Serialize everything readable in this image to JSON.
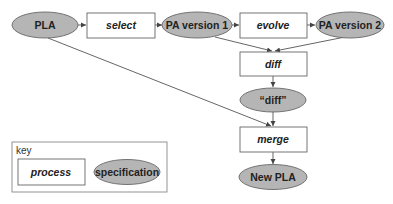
{
  "diagram": {
    "colors": {
      "specification_fill": "#b5b5b5",
      "stroke": "#555555",
      "process_fill": "#ffffff"
    },
    "nodes": {
      "pla": {
        "type": "specification",
        "label": "PLA"
      },
      "select": {
        "type": "process",
        "label": "select"
      },
      "pa_v1": {
        "type": "specification",
        "label": "PA version 1"
      },
      "evolve": {
        "type": "process",
        "label": "evolve"
      },
      "pa_v2": {
        "type": "specification",
        "label": "PA version 2"
      },
      "diff_proc": {
        "type": "process",
        "label": "diff"
      },
      "diff_spec": {
        "type": "specification",
        "label": "“diff”"
      },
      "merge": {
        "type": "process",
        "label": "merge"
      },
      "new_pla": {
        "type": "specification",
        "label": "New PLA"
      }
    },
    "edges": [
      {
        "from": "PLA",
        "to": "select"
      },
      {
        "from": "select",
        "to": "PA version 1"
      },
      {
        "from": "PA version 1",
        "to": "evolve"
      },
      {
        "from": "evolve",
        "to": "PA version 2"
      },
      {
        "from": "PA version 1",
        "to": "diff"
      },
      {
        "from": "PA version 2",
        "to": "diff"
      },
      {
        "from": "diff",
        "to": "“diff”"
      },
      {
        "from": "“diff”",
        "to": "merge"
      },
      {
        "from": "PLA",
        "to": "merge"
      },
      {
        "from": "merge",
        "to": "New PLA"
      }
    ],
    "key": {
      "title": "key",
      "process_label": "process",
      "specification_label": "specification"
    }
  }
}
